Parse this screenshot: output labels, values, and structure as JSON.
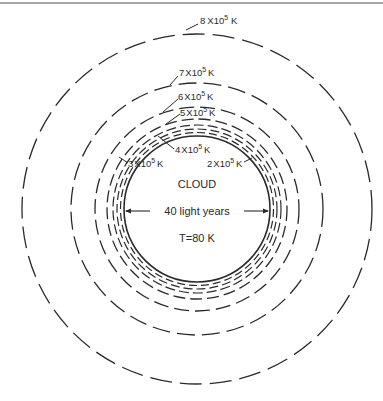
{
  "figure": {
    "center": {
      "x": 197,
      "y": 209
    },
    "cloud": {
      "label": "CLOUD",
      "diameter_label": "40 light years",
      "temperature_label": "T=80 K",
      "radius_px": 73
    },
    "shells": [
      {
        "label_mantissa": "2",
        "label_base": "X10",
        "label_exp": "5",
        "label_unit": "K",
        "radius_px": 76
      },
      {
        "label_mantissa": "3",
        "label_base": "X10",
        "label_exp": "5",
        "label_unit": "K",
        "radius_px": 79
      },
      {
        "label_mantissa": "4",
        "label_base": "X10",
        "label_exp": "5",
        "label_unit": "K",
        "radius_px": 83
      },
      {
        "label_mantissa": "5",
        "label_base": "X10",
        "label_exp": "5",
        "label_unit": "K",
        "radius_px": 90
      },
      {
        "label_mantissa": "6",
        "label_base": "X10",
        "label_exp": "5",
        "label_unit": "K",
        "radius_px": 102
      },
      {
        "label_mantissa": "7",
        "label_base": "X10",
        "label_exp": "5",
        "label_unit": "K",
        "radius_px": 126
      },
      {
        "label_mantissa": "8",
        "label_base": "X10",
        "label_exp": "5",
        "label_unit": "K",
        "radius_px": 175
      }
    ],
    "colors": {
      "ink": "#2a2a2a",
      "background": "#ffffff"
    }
  }
}
